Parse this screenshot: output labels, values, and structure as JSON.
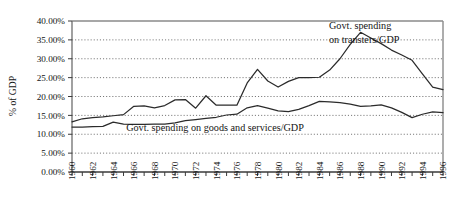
{
  "chart_data": {
    "type": "line",
    "title": "",
    "xlabel": "",
    "ylabel": "% of GDP",
    "xlim": [
      1960,
      1996
    ],
    "ylim": [
      0,
      40
    ],
    "ytick_format": "percent_2dp",
    "grid": "horizontal-dotted",
    "legend": "inline-annotations",
    "yticks": [
      0,
      5,
      10,
      15,
      20,
      25,
      30,
      35,
      40
    ],
    "ytick_labels": [
      "0.00%",
      "5.00%",
      "10.00%",
      "15.00%",
      "20.00%",
      "25.00%",
      "30.00%",
      "35.00%",
      "40.00%"
    ],
    "x": [
      1960,
      1961,
      1962,
      1963,
      1964,
      1965,
      1966,
      1967,
      1968,
      1969,
      1970,
      1971,
      1972,
      1973,
      1974,
      1975,
      1976,
      1977,
      1978,
      1979,
      1980,
      1981,
      1982,
      1983,
      1984,
      1985,
      1986,
      1987,
      1988,
      1989,
      1990,
      1991,
      1992,
      1993,
      1994,
      1995,
      1996
    ],
    "xtick_labels": [
      "1960",
      "1962",
      "1964",
      "1966",
      "1968",
      "1970",
      "1972",
      "1974",
      "1976",
      "1978",
      "1980",
      "1982",
      "1984",
      "1986",
      "1988",
      "1990",
      "1992",
      "1994",
      "1996"
    ],
    "xtick_label_step": 2,
    "series": [
      {
        "name": "Govt. spending on transfers/GDP",
        "values": [
          13.3,
          14.1,
          14.4,
          14.6,
          14.9,
          15.2,
          17.4,
          17.5,
          17.0,
          17.6,
          19.1,
          19.2,
          16.9,
          20.2,
          17.7,
          17.7,
          17.7,
          23.6,
          27.2,
          24.1,
          22.5,
          24.0,
          25.0,
          25.0,
          25.1,
          27.0,
          30.0,
          33.8,
          37.0,
          35.5,
          34.0,
          32.3,
          31.0,
          29.6,
          26.0,
          22.5,
          21.8
        ],
        "peak_year": 1988,
        "peak_value": 37.0,
        "end_value": 22.5
      },
      {
        "name": "Govt. spending on goods and services/GDP",
        "values": [
          11.9,
          11.9,
          12.0,
          12.1,
          13.2,
          12.7,
          12.6,
          12.6,
          12.7,
          12.7,
          13.0,
          13.6,
          13.9,
          14.2,
          14.5,
          15.1,
          15.3,
          17.0,
          17.6,
          16.9,
          16.2,
          16.0,
          16.6,
          17.6,
          18.7,
          18.6,
          18.4,
          18.0,
          17.4,
          17.5,
          17.8,
          17.0,
          15.8,
          14.4,
          15.3,
          15.9,
          15.7
        ],
        "end_value": 14.8
      }
    ],
    "annotations": [
      {
        "name": "transfers-annotation",
        "line1": "Govt. spending",
        "line2": "on transters/GDP"
      },
      {
        "name": "goods-services-annotation",
        "text": "Govt. spending on goods and services/GDP"
      }
    ],
    "colors": {
      "line": "#2b2b2b",
      "grid": "#555555",
      "axis": "#777777",
      "background": "#ffffff"
    }
  }
}
